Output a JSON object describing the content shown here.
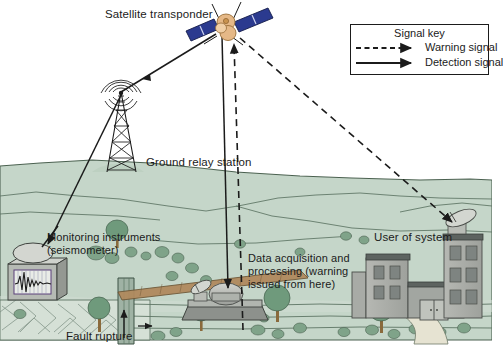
{
  "figure": {
    "type": "diagram",
    "background_color": "#ffffff",
    "land_color": "#c5d6c9",
    "line_color": "#1b1b1b"
  },
  "labels": {
    "satellite_transponder": "Satellite transponder",
    "ground_relay_station": "Ground relay station",
    "monitoring_instruments": "Monitoring instruments\n(seismometer)",
    "data_acquisition": "Data acquisition and\nprocessing (warning\nissued from here)",
    "user_of_system": "User of system",
    "fault_rupture": "Fault rupture"
  },
  "legend": {
    "title": "Signal key",
    "items": [
      {
        "label": "Warning signal",
        "style": "dashed",
        "arrow": true,
        "color": "#1b1b1b"
      },
      {
        "label": "Detection signal",
        "style": "solid",
        "arrow": true,
        "color": "#1b1b1b"
      }
    ]
  },
  "objects": {
    "satellite": {
      "body_color": "#e0b183",
      "panel_color": "#2b3a8f"
    },
    "tower": "lattice radio tower with broadcast waves",
    "seismometer": "instrument box with seismograph trace and antenna dish",
    "data_station": "platform with dish antenna and radome",
    "user_buildings": "office buildings with rooftop satellite dish",
    "fault": "vertical fault rupture with offset strata"
  },
  "signal_paths": [
    {
      "name": "seismometer-to-relay",
      "style": "solid",
      "from": "monitoring instruments",
      "to": "ground relay station"
    },
    {
      "name": "relay-to-satellite",
      "style": "solid",
      "from": "ground relay station",
      "to": "satellite transponder"
    },
    {
      "name": "satellite-to-data-acquisition",
      "style": "solid",
      "from": "satellite transponder",
      "to": "data acquisition station"
    },
    {
      "name": "data-acquisition-to-satellite",
      "style": "dashed",
      "from": "data acquisition station",
      "to": "satellite transponder"
    },
    {
      "name": "satellite-to-user",
      "style": "dashed",
      "from": "satellite transponder",
      "to": "user of system"
    }
  ]
}
